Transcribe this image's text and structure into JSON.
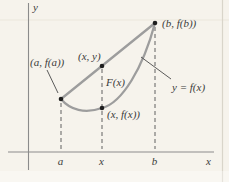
{
  "colors": {
    "background": "#f6f3ec",
    "curve": "#9d9d9d",
    "secant": "#9d9d9d",
    "axis": "#8b8b8b",
    "dashed": "#606060",
    "callout": "#4a4a4a",
    "dot": "#1e1e1e",
    "text": "#3b3b3b",
    "artifact": "#e9e5da",
    "page_edge": "#d9d5ca"
  },
  "axes": {
    "y_label": "y",
    "x_label": "x"
  },
  "ticks": {
    "a_label": "a",
    "x_label": "x",
    "b_label": "b"
  },
  "labels": {
    "point_a": "(a, f(a))",
    "point_xy": "(x, y)",
    "segment_F": "F(x)",
    "point_xfx": "(x, f(x))",
    "point_b": "(b, f(b))",
    "curve": "y = f(x)"
  }
}
